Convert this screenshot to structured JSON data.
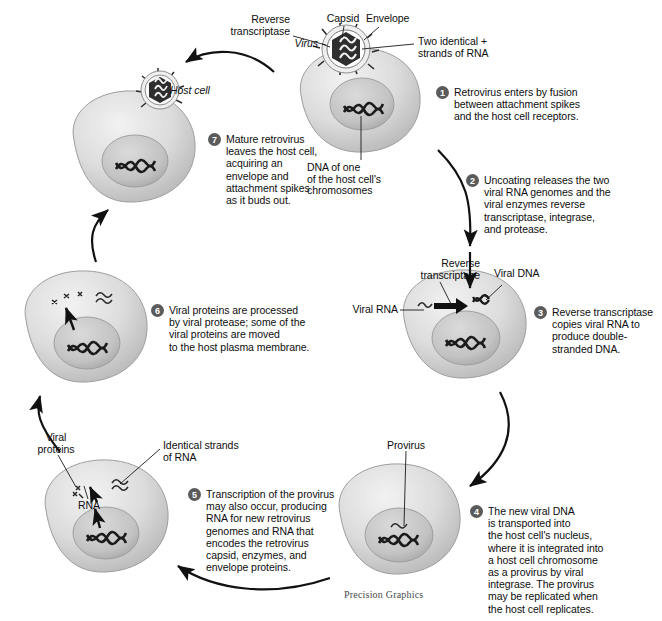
{
  "figure": {
    "credit": "Precision Graphics"
  },
  "colors": {
    "step_badge": "#5b5b5b",
    "cell_body": "#d9d9d9",
    "cell_edge": "#9a9a9a",
    "nucleus": "#c2c2c2",
    "dna": "#1b1b1b",
    "arrow": "#111111",
    "text": "#0d0d0d"
  },
  "labels": {
    "reverse_transcriptase_top": "Reverse\ntranscriptase",
    "capsid": "Capsid",
    "envelope": "Envelope",
    "virus": "Virus",
    "two_strands": "Two identical +\nstrands of RNA",
    "host_cell": "Host cell",
    "dna_chromosome": "DNA of one\nof the host cell's\nchromosomes",
    "reverse_transcriptase_mid": "Reverse\ntranscriptase",
    "viral_dna": "Viral DNA",
    "viral_rna": "Viral RNA",
    "provirus": "Provirus",
    "viral_proteins": "Viral\nproteins",
    "identical_strands": "Identical strands\nof RNA",
    "rna": "RNA"
  },
  "steps": [
    {
      "number": "1",
      "text": "Retrovirus enters by fusion\nbetween attachment spikes\nand the host cell receptors."
    },
    {
      "number": "2",
      "text": "Uncoating releases the two\nviral RNA genomes and the\nviral enzymes reverse\ntranscriptase, integrase,\nand protease."
    },
    {
      "number": "3",
      "text": "Reverse transcriptase\ncopies viral RNA to\nproduce double-\nstranded DNA."
    },
    {
      "number": "4",
      "text": "The new viral DNA\nis transported into\nthe host cell's nucleus,\nwhere it is integrated into\na host cell chromosome\nas a provirus by viral\nintegrase. The provirus\nmay be replicated when\nthe host cell replicates."
    },
    {
      "number": "5",
      "text": "Transcription of the provirus\nmay also occur, producing\nRNA for new retrovirus\ngenomes and RNA that\nencodes the retrovirus\ncapsid, enzymes, and\nenvelope proteins."
    },
    {
      "number": "6",
      "text": "Viral proteins are processed\nby viral protease; some of the\nviral proteins are moved\nto the host plasma membrane."
    },
    {
      "number": "7",
      "text": "Mature retrovirus\nleaves the host cell,\nacquiring an\nenvelope and\nattachment spikes\nas it buds out."
    }
  ]
}
